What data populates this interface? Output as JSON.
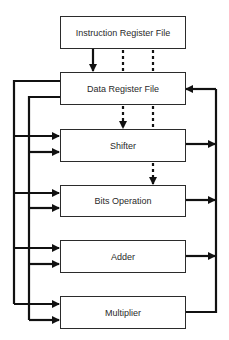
{
  "diagram": {
    "type": "block-diagram",
    "blocks": [
      {
        "id": "instruction-register-file",
        "label": "Instruction Register File"
      },
      {
        "id": "data-register-file",
        "label": "Data Register File"
      },
      {
        "id": "shifter",
        "label": "Shifter"
      },
      {
        "id": "bits-operation",
        "label": "Bits Operation"
      },
      {
        "id": "adder",
        "label": "Adder"
      },
      {
        "id": "multiplier",
        "label": "Multiplier"
      }
    ],
    "edges": [
      {
        "from": "instruction-register-file",
        "to": "data-register-file",
        "style": "solid"
      },
      {
        "from": "instruction-register-file",
        "to": "data-register-file",
        "style": "dotted"
      },
      {
        "from": "instruction-register-file",
        "to": "data-register-file",
        "style": "dotted"
      },
      {
        "from": "data-register-file",
        "to": "shifter",
        "style": "dotted-arrow"
      },
      {
        "from": "data-register-file",
        "to": "bits-operation",
        "style": "dotted-arrow"
      },
      {
        "from": "data-register-file",
        "to": "shifter",
        "style": "solid-bus-left"
      },
      {
        "from": "data-register-file",
        "to": "bits-operation",
        "style": "solid-bus-left"
      },
      {
        "from": "data-register-file",
        "to": "adder",
        "style": "solid-bus-left"
      },
      {
        "from": "data-register-file",
        "to": "multiplier",
        "style": "solid-bus-left"
      },
      {
        "from": "shifter",
        "to": "data-register-file",
        "style": "solid-bus-right"
      },
      {
        "from": "bits-operation",
        "to": "data-register-file",
        "style": "solid-bus-right"
      },
      {
        "from": "adder",
        "to": "data-register-file",
        "style": "solid-bus-right"
      },
      {
        "from": "multiplier",
        "to": "data-register-file",
        "style": "solid-bus-right"
      }
    ]
  },
  "colors": {
    "line": "#111111",
    "border": "#2b2b2b",
    "text": "#2a2a2a",
    "background": "#ffffff"
  }
}
